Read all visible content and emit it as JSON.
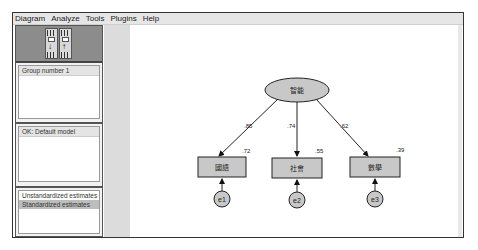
{
  "menu": [
    "Diagram",
    "Analyze",
    "Tools",
    "Plugins",
    "Help"
  ],
  "toolbar": {
    "buttons": [
      {
        "name": "view-input-path-diagram",
        "arrow": "↓"
      },
      {
        "name": "view-output-path-diagram",
        "arrow": "↑"
      }
    ]
  },
  "panels": {
    "groups": {
      "header": "Group number 1"
    },
    "models": {
      "header": "OK: Default model"
    },
    "estimates": {
      "items": [
        "Unstandardized estimates",
        "Standardized estimates"
      ],
      "selected": 1
    }
  },
  "diagram": {
    "latent": {
      "label": "智能"
    },
    "observed": [
      {
        "label": "國語",
        "r2": ".72",
        "loading": ".85",
        "error": "e1"
      },
      {
        "label": "社會",
        "r2": ".55",
        "loading": ".74",
        "error": "e2"
      },
      {
        "label": "數學",
        "r2": ".39",
        "loading": ".62",
        "error": "e3"
      }
    ],
    "colors": {
      "node_fill": "#c8c8c8",
      "stroke": "#222222"
    }
  }
}
